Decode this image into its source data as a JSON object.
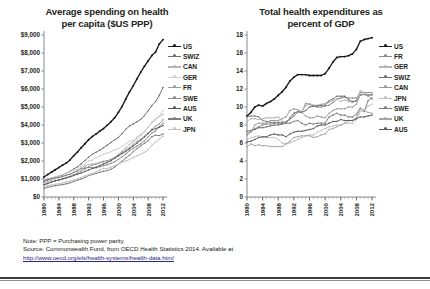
{
  "footnotes": {
    "note": "Note: PPP = Purchasing power parity.",
    "source": "Source: Commonwealth Fund, from OECD Health Statistics 2014. Available at",
    "url": "http://www.oecd.org/els/health-systems/health-data.htm/"
  },
  "chart_data": [
    {
      "id": "spending-per-capita",
      "type": "line",
      "title": "Average spending on health\nper capita ($US PPP)",
      "xlabel": "",
      "ylabel": "",
      "xlim": [
        1980,
        2012
      ],
      "ylim": [
        0,
        9000
      ],
      "yticks": [
        0,
        1000,
        2000,
        3000,
        4000,
        5000,
        6000,
        7000,
        8000,
        9000
      ],
      "ytick_labels": [
        "$0",
        "$1,000",
        "$2,000",
        "$3,000",
        "$4,000",
        "$5,000",
        "$6,000",
        "$7,000",
        "$8,000",
        "$9,000"
      ],
      "xticks": [
        1980,
        1984,
        1988,
        1992,
        1996,
        2000,
        2004,
        2008,
        2012
      ],
      "xtick_labels": [
        "1980",
        "1984",
        "1988",
        "1992",
        "1996",
        "2000",
        "2004",
        "2008",
        "2012"
      ],
      "grid": false,
      "legend_position": "right",
      "x": [
        1980,
        1981,
        1982,
        1983,
        1984,
        1985,
        1986,
        1987,
        1988,
        1989,
        1990,
        1991,
        1992,
        1993,
        1994,
        1995,
        1996,
        1997,
        1998,
        1999,
        2000,
        2001,
        2002,
        2003,
        2004,
        2005,
        2006,
        2007,
        2008,
        2009,
        2010,
        2011,
        2012
      ],
      "series": [
        {
          "name": "US",
          "color": "#1a1a1a",
          "values": [
            1110,
            1250,
            1380,
            1510,
            1640,
            1770,
            1890,
            2060,
            2290,
            2500,
            2740,
            2960,
            3180,
            3360,
            3500,
            3660,
            3800,
            3980,
            4180,
            4400,
            4700,
            5030,
            5450,
            5840,
            6180,
            6560,
            6930,
            7260,
            7560,
            7860,
            8050,
            8500,
            8745
          ]
        },
        {
          "name": "SWIZ",
          "color": "#6e6e6e",
          "values": [
            860,
            940,
            1020,
            1090,
            1160,
            1230,
            1320,
            1430,
            1550,
            1680,
            1850,
            2030,
            2210,
            2370,
            2490,
            2600,
            2740,
            2880,
            3030,
            3180,
            3300,
            3530,
            3760,
            3950,
            4060,
            4180,
            4310,
            4520,
            4790,
            5080,
            5300,
            5640,
            6080
          ]
        },
        {
          "name": "CAN",
          "color": "#b5b5b5",
          "values": [
            780,
            860,
            950,
            1010,
            1070,
            1130,
            1200,
            1280,
            1380,
            1470,
            1620,
            1720,
            1800,
            1830,
            1850,
            1900,
            1930,
            1990,
            2080,
            2200,
            2380,
            2540,
            2740,
            2920,
            3070,
            3250,
            3430,
            3620,
            3870,
            4150,
            4330,
            4470,
            4600
          ]
        },
        {
          "name": "GER",
          "color": "#cfcfcf",
          "values": [
            940,
            1010,
            1070,
            1120,
            1180,
            1250,
            1330,
            1400,
            1500,
            1540,
            1730,
            1830,
            2000,
            2060,
            2190,
            2270,
            2390,
            2430,
            2510,
            2620,
            2690,
            2820,
            2960,
            3090,
            3150,
            3350,
            3480,
            3650,
            3890,
            4120,
            4290,
            4490,
            4810
          ]
        },
        {
          "name": "FR",
          "color": "#9a9a9a",
          "values": [
            670,
            740,
            820,
            890,
            950,
            1010,
            1080,
            1150,
            1240,
            1320,
            1450,
            1560,
            1680,
            1760,
            1830,
            1920,
            1980,
            2020,
            2090,
            2190,
            2310,
            2470,
            2620,
            2740,
            2910,
            3090,
            3210,
            3370,
            3560,
            3760,
            3930,
            4060,
            4290
          ]
        },
        {
          "name": "SWE",
          "color": "#8a8a8a",
          "values": [
            930,
            990,
            1030,
            1060,
            1090,
            1150,
            1210,
            1270,
            1360,
            1450,
            1570,
            1610,
            1640,
            1620,
            1620,
            1680,
            1740,
            1790,
            1870,
            1960,
            2090,
            2230,
            2390,
            2570,
            2700,
            2840,
            2960,
            3130,
            3330,
            3550,
            3670,
            3900,
            4100
          ]
        },
        {
          "name": "AUS",
          "color": "#5a5a5a",
          "values": [
            690,
            760,
            840,
            900,
            940,
            1000,
            1060,
            1120,
            1190,
            1270,
            1340,
            1420,
            1500,
            1580,
            1650,
            1750,
            1830,
            1910,
            2020,
            2150,
            2280,
            2410,
            2530,
            2680,
            2830,
            2990,
            3150,
            3330,
            3520,
            3720,
            3800,
            3870,
            3970
          ]
        },
        {
          "name": "UK",
          "color": "#7d7d7d",
          "values": [
            480,
            540,
            580,
            630,
            660,
            690,
            730,
            790,
            860,
            930,
            1000,
            1080,
            1190,
            1250,
            1310,
            1370,
            1430,
            1470,
            1540,
            1660,
            1830,
            1990,
            2160,
            2320,
            2520,
            2690,
            2840,
            2990,
            3120,
            3350,
            3430,
            3410,
            3500
          ]
        },
        {
          "name": "JPN",
          "color": "#c2c2c2",
          "values": [
            580,
            630,
            670,
            710,
            740,
            780,
            840,
            890,
            950,
            1000,
            1090,
            1160,
            1240,
            1310,
            1400,
            1500,
            1580,
            1590,
            1660,
            1750,
            1840,
            1930,
            2000,
            2080,
            2180,
            2290,
            2370,
            2480,
            2610,
            2880,
            3040,
            3210,
            3380
          ]
        }
      ]
    },
    {
      "id": "percent-of-gdp",
      "type": "line",
      "title": "Total health expenditures as\npercent of GDP",
      "xlabel": "",
      "ylabel": "",
      "xlim": [
        1980,
        2012
      ],
      "ylim": [
        0,
        18
      ],
      "yticks": [
        0,
        2,
        4,
        6,
        8,
        10,
        12,
        14,
        16,
        18
      ],
      "ytick_labels": [
        "0",
        "2",
        "4",
        "6",
        "8",
        "10",
        "12",
        "14",
        "16",
        "18"
      ],
      "xticks": [
        1980,
        1984,
        1988,
        1992,
        1996,
        2000,
        2004,
        2008,
        2012
      ],
      "xtick_labels": [
        "1980",
        "1984",
        "1988",
        "1992",
        "1996",
        "2000",
        "2004",
        "2008",
        "2012"
      ],
      "grid": false,
      "legend_position": "right",
      "x": [
        1980,
        1981,
        1982,
        1983,
        1984,
        1985,
        1986,
        1987,
        1988,
        1989,
        1990,
        1991,
        1992,
        1993,
        1994,
        1995,
        1996,
        1997,
        1998,
        1999,
        2000,
        2001,
        2002,
        2003,
        2004,
        2005,
        2006,
        2007,
        2008,
        2009,
        2010,
        2011,
        2012
      ],
      "series": [
        {
          "name": "US",
          "color": "#1a1a1a",
          "values": [
            9.0,
            9.4,
            10.0,
            10.2,
            10.1,
            10.4,
            10.6,
            10.9,
            11.3,
            11.7,
            12.2,
            12.9,
            13.3,
            13.6,
            13.6,
            13.6,
            13.5,
            13.5,
            13.5,
            13.5,
            13.7,
            14.3,
            15.0,
            15.5,
            15.6,
            15.6,
            15.7,
            15.9,
            16.4,
            17.3,
            17.5,
            17.6,
            17.7
          ]
        },
        {
          "name": "FR",
          "color": "#8a8a8a",
          "values": [
            7.0,
            7.3,
            7.6,
            7.8,
            8.0,
            8.1,
            8.1,
            8.2,
            8.3,
            8.3,
            8.4,
            8.6,
            9.0,
            9.4,
            9.4,
            10.4,
            10.3,
            10.1,
            10.0,
            10.0,
            10.1,
            10.2,
            10.5,
            10.9,
            11.0,
            11.1,
            11.0,
            11.0,
            11.0,
            11.6,
            11.6,
            11.6,
            11.6
          ]
        },
        {
          "name": "GER",
          "color": "#b5b5b5",
          "values": [
            8.4,
            8.7,
            8.7,
            8.6,
            8.7,
            8.8,
            8.8,
            8.8,
            8.9,
            8.4,
            8.3,
            8.6,
            9.3,
            9.4,
            9.5,
            10.1,
            10.4,
            10.2,
            10.2,
            10.3,
            10.4,
            10.5,
            10.7,
            10.9,
            10.6,
            10.8,
            10.6,
            10.5,
            10.7,
            11.8,
            11.6,
            11.3,
            11.3
          ]
        },
        {
          "name": "SWIZ",
          "color": "#6e6e6e",
          "values": [
            7.3,
            7.4,
            7.5,
            7.7,
            7.7,
            7.8,
            7.9,
            8.0,
            8.0,
            8.1,
            8.2,
            8.8,
            9.3,
            9.5,
            9.4,
            9.6,
            10.0,
            10.1,
            10.1,
            10.2,
            10.2,
            10.7,
            10.9,
            11.2,
            11.2,
            11.2,
            10.8,
            10.6,
            10.7,
            11.3,
            11.4,
            11.3,
            11.4
          ]
        },
        {
          "name": "CAN",
          "color": "#9a9a9a",
          "values": [
            6.9,
            7.2,
            8.0,
            8.2,
            8.2,
            8.2,
            8.5,
            8.5,
            8.5,
            8.7,
            8.9,
            9.6,
            9.8,
            9.7,
            9.5,
            9.0,
            8.8,
            8.8,
            9.0,
            8.9,
            8.8,
            9.3,
            9.6,
            9.8,
            9.8,
            9.8,
            10.0,
            10.0,
            10.3,
            11.4,
            11.4,
            11.2,
            10.9
          ]
        },
        {
          "name": "JPN",
          "color": "#c2c2c2",
          "values": [
            6.4,
            6.6,
            6.7,
            6.8,
            6.6,
            6.6,
            6.6,
            6.6,
            6.4,
            6.0,
            5.9,
            6.0,
            6.2,
            6.4,
            6.6,
            6.8,
            6.9,
            6.9,
            7.2,
            7.4,
            7.6,
            7.8,
            7.9,
            8.0,
            8.0,
            8.2,
            8.2,
            8.2,
            8.6,
            9.5,
            9.6,
            10.1,
            10.3
          ]
        },
        {
          "name": "SWE",
          "color": "#7d7d7d",
          "values": [
            8.9,
            9.0,
            9.0,
            8.9,
            8.5,
            8.4,
            8.3,
            8.3,
            8.2,
            8.2,
            8.2,
            8.2,
            8.4,
            8.5,
            8.2,
            8.0,
            8.2,
            8.1,
            8.2,
            8.2,
            8.2,
            8.9,
            9.1,
            9.3,
            9.1,
            9.1,
            8.9,
            8.9,
            9.2,
            9.9,
            9.5,
            10.7,
            11.0
          ]
        },
        {
          "name": "UK",
          "color": "#a6a6a6",
          "values": [
            5.6,
            5.9,
            5.7,
            5.8,
            5.7,
            5.7,
            5.6,
            5.6,
            5.6,
            5.6,
            5.9,
            6.2,
            6.6,
            6.7,
            6.8,
            6.8,
            6.8,
            6.6,
            6.7,
            6.9,
            7.0,
            7.5,
            7.6,
            7.8,
            8.0,
            8.2,
            8.5,
            8.5,
            8.8,
            9.8,
            9.6,
            9.4,
            9.3
          ]
        },
        {
          "name": "AUS",
          "color": "#5a5a5a",
          "values": [
            6.1,
            6.2,
            6.4,
            6.6,
            6.7,
            6.7,
            6.9,
            7.0,
            6.9,
            6.9,
            6.7,
            7.0,
            7.2,
            7.3,
            7.3,
            7.4,
            7.5,
            7.6,
            7.9,
            8.0,
            8.0,
            8.2,
            8.4,
            8.4,
            8.6,
            8.5,
            8.5,
            8.5,
            8.7,
            8.9,
            8.9,
            9.0,
            9.1
          ]
        }
      ]
    }
  ]
}
